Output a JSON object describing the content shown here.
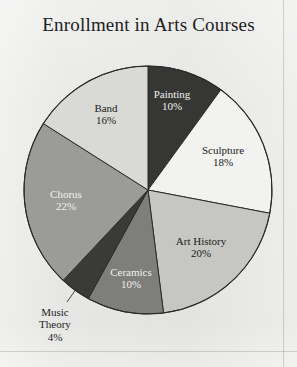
{
  "chart_title": "Enrollment in Arts Courses",
  "background_color": "#e9e9e7",
  "chart_data": {
    "type": "pie",
    "title": "Enrollment in Arts Courses",
    "xlabel": "",
    "ylabel": "",
    "legend": "none",
    "grid": false,
    "start_angle_deg": 0,
    "direction": "clockwise",
    "units": "percent",
    "categories": [
      "Painting",
      "Sculpture",
      "Art History",
      "Ceramics",
      "Music Theory",
      "Chorus",
      "Band"
    ],
    "values": [
      10,
      18,
      20,
      10,
      4,
      22,
      16
    ],
    "value_labels": [
      "10%",
      "18%",
      "20%",
      "10%",
      "4%",
      "22%",
      "16%"
    ],
    "slice_colors": [
      "#363635",
      "#f2f2f0",
      "#c6c6c3",
      "#7e7e7b",
      "#3a3a38",
      "#9b9b98",
      "#d9d9d6"
    ],
    "slices": [
      {
        "name": "Painting",
        "value": 10,
        "value_label": "10%",
        "color": "#363635",
        "label_color": "#f0f0ee",
        "label_position": "inside",
        "label_x": 172,
        "label_y": 96,
        "leader_line": false
      },
      {
        "name": "Sculpture",
        "value": 18,
        "value_label": "18%",
        "color": "#f2f2f0",
        "label_color": "#1c1c1c",
        "label_position": "inside",
        "label_x": 222,
        "label_y": 152,
        "leader_line": false
      },
      {
        "name": "Art History",
        "value": 20,
        "value_label": "20%",
        "color": "#c6c6c3",
        "label_color": "#1c1c1c",
        "label_position": "inside",
        "label_x": 200,
        "label_y": 243,
        "leader_line": false
      },
      {
        "name": "Ceramics",
        "value": 10,
        "value_label": "10%",
        "color": "#7e7e7b",
        "label_color": "#f0f0ee",
        "label_position": "inside",
        "label_x": 131,
        "label_y": 274,
        "leader_line": false
      },
      {
        "name": "Music Theory",
        "value": 4,
        "value_label": "4%",
        "color": "#3a3a38",
        "label_color": "#1c1c1c",
        "label_position": "outside",
        "label_x": 55,
        "label_y": 318,
        "leader_line": true
      },
      {
        "name": "Chorus",
        "value": 22,
        "value_label": "22%",
        "color": "#9b9b98",
        "label_color": "#f0f0ee",
        "label_position": "inside",
        "label_x": 66,
        "label_y": 196,
        "leader_line": false
      },
      {
        "name": "Band",
        "value": 16,
        "value_label": "16%",
        "color": "#d9d9d6",
        "label_color": "#1c1c1c",
        "label_position": "inside",
        "label_x": 106,
        "label_y": 110,
        "leader_line": false
      }
    ],
    "geometry": {
      "center_x": 148,
      "center_y": 190,
      "radius": 124,
      "outline_color": "#2b2b2b"
    }
  },
  "label_lines": {
    "music_theory_line1": "Music",
    "music_theory_line2": "Theory"
  }
}
